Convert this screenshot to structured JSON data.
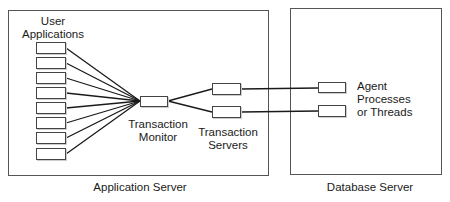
{
  "diagram": {
    "application_server": {
      "label": "Application Server",
      "user_applications_label": [
        "User",
        "Applications"
      ],
      "user_application_count": 8,
      "transaction_monitor_label": [
        "Transaction",
        "Monitor"
      ],
      "transaction_servers_label": [
        "Transaction",
        "Servers"
      ],
      "transaction_server_count": 2
    },
    "database_server": {
      "label": "Database Server",
      "agents_label": [
        "Agent",
        "Processes",
        "or Threads"
      ],
      "agent_count": 2
    },
    "colors": {
      "line": "#1a1a1a",
      "border": "#555555",
      "background": "#ffffff"
    }
  }
}
